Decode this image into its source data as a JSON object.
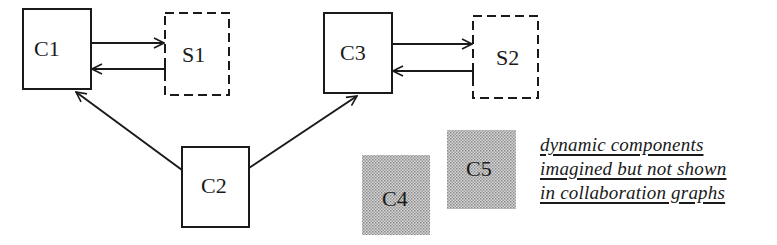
{
  "diagram": {
    "nodes": [
      {
        "id": "C1",
        "label": "C1",
        "kind": "static-component"
      },
      {
        "id": "S1",
        "label": "S1",
        "kind": "server-dashed"
      },
      {
        "id": "C3",
        "label": "C3",
        "kind": "static-component"
      },
      {
        "id": "S2",
        "label": "S2",
        "kind": "server-dashed"
      },
      {
        "id": "C2",
        "label": "C2",
        "kind": "static-component"
      },
      {
        "id": "C4",
        "label": "C4",
        "kind": "dynamic-component-shaded"
      },
      {
        "id": "C5",
        "label": "C5",
        "kind": "dynamic-component-shaded"
      }
    ],
    "edges": [
      {
        "from": "C1",
        "to": "S1"
      },
      {
        "from": "S1",
        "to": "C1"
      },
      {
        "from": "C3",
        "to": "S2"
      },
      {
        "from": "S2",
        "to": "C3"
      },
      {
        "from": "C2",
        "to": "C1"
      },
      {
        "from": "C2",
        "to": "C3"
      }
    ],
    "note": {
      "lines": [
        "dynamic components",
        "imagined but not shown",
        "in collaboration graphs"
      ]
    },
    "colors": {
      "stroke": "#1a1a1a",
      "shade": "#b8b8b8",
      "background": "#ffffff"
    }
  }
}
